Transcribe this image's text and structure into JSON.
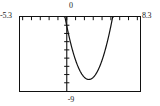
{
  "screen": {
    "kind": "graphing-calculator-plot",
    "background_color": "#ffffff",
    "frame_color": "#111111",
    "curve_color": "#111111"
  },
  "labels": {
    "x_min": "-5.3",
    "x_max": "8.3",
    "y_max": "0",
    "y_min": "-9"
  },
  "chart_data": {
    "type": "line",
    "title": "",
    "subtitle": "",
    "xlabel": "",
    "ylabel": "",
    "xlim": [
      -5.3,
      8.3
    ],
    "ylim": [
      -9,
      0
    ],
    "grid": false,
    "legend": null,
    "legend_position": "none",
    "axis_style": "calculator-window",
    "x_tick_step": 1,
    "y_tick_step": 1,
    "x_tick_values": [
      -5,
      -4,
      -3,
      -2,
      -1,
      0,
      1,
      2,
      3,
      4,
      5,
      6,
      7,
      8
    ],
    "y_tick_values": [
      -9,
      -8,
      -7,
      -6,
      -5,
      -4,
      -3,
      -2,
      -1,
      0
    ],
    "tick_marks_on": [
      "top-edge",
      "y-axis"
    ],
    "axes_drawn": [
      "x-axis-at-y-0",
      "y-axis-at-x-0"
    ],
    "annotations": [
      {
        "text": "-5.3",
        "position": "left-of-frame-top",
        "meaning": "Xmin"
      },
      {
        "text": "8.3",
        "position": "right-of-frame-top",
        "meaning": "Xmax"
      },
      {
        "text": "0",
        "position": "above-frame-center",
        "meaning": "Ymax"
      },
      {
        "text": "-9",
        "position": "below-frame-center",
        "meaning": "Ymin"
      }
    ],
    "series": [
      {
        "name": "parabola",
        "kind": "quadratic",
        "vertex": [
          2.5,
          -7.6
        ],
        "roots": [
          -0.2,
          5.2
        ],
        "x": [
          -0.4,
          -0.2,
          0.0,
          0.25,
          0.5,
          0.75,
          1.0,
          1.25,
          1.5,
          1.75,
          2.0,
          2.25,
          2.5,
          2.75,
          3.0,
          3.25,
          3.5,
          3.75,
          4.0,
          4.25,
          4.5,
          4.75,
          5.0,
          5.2,
          5.4
        ],
        "values": [
          1.3,
          0.0,
          -1.22,
          -2.53,
          -3.67,
          -4.66,
          -5.48,
          -6.15,
          -6.65,
          -7.0,
          -7.19,
          -7.22,
          -7.6,
          -7.19,
          -7.22,
          -7.19,
          -7.0,
          -6.65,
          -6.15,
          -5.48,
          -4.66,
          -3.67,
          -2.53,
          -0.6,
          0.8
        ]
      }
    ]
  }
}
